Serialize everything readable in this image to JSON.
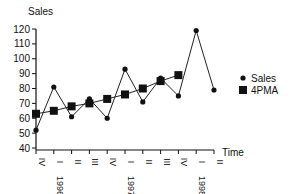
{
  "chart_data": {
    "type": "line",
    "title": "",
    "ylabel": "Sales",
    "xlabel": "Time",
    "ylim": [
      40,
      120
    ],
    "yticks": [
      40,
      50,
      60,
      70,
      80,
      90,
      100,
      110,
      120
    ],
    "categories": [
      "IV",
      "I",
      "II",
      "III",
      "IV",
      "I",
      "II",
      "III",
      "IV",
      "I",
      "II"
    ],
    "year_labels": [
      {
        "label": "1996",
        "index": 1
      },
      {
        "label": "1997",
        "index": 5
      },
      {
        "label": "1998",
        "index": 9
      }
    ],
    "series": [
      {
        "name": "Sales",
        "marker": "circle",
        "values": [
          52,
          81,
          61,
          73,
          60,
          93,
          71,
          87,
          75,
          119,
          79
        ]
      },
      {
        "name": "4PMA",
        "marker": "square",
        "values": [
          63,
          65,
          68,
          70,
          73,
          76,
          80,
          85,
          89,
          null,
          null
        ]
      }
    ],
    "legend": {
      "position": "right",
      "entries": [
        "Sales",
        "4PMA"
      ]
    },
    "grid": false
  }
}
